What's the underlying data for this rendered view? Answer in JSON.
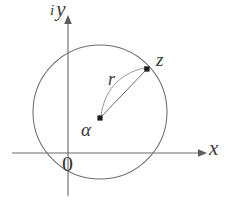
{
  "figure": {
    "name": "complex-plane-disk-diagram",
    "background_color": "#ffffff",
    "stroke_color": "#5a5a5a",
    "label_color": "#3a3a3a",
    "axes": {
      "x_label": "x",
      "y_label": "y",
      "y_label_prefix": "i",
      "origin_label": "0",
      "x_axis_y_px": 153,
      "y_axis_x_px": 68,
      "x_arrow": "arrow-right",
      "y_arrow": "arrow-up"
    },
    "circle": {
      "center_x_px": 100,
      "center_y_px": 112,
      "radius_px": 67,
      "filled": false
    },
    "points": [
      {
        "id": "alpha",
        "label": "α",
        "x_px": 100,
        "y_px": 118,
        "marker": "filled-square"
      },
      {
        "id": "z",
        "label": "z",
        "x_px": 147,
        "y_px": 69,
        "marker": "filled-square"
      }
    ],
    "segments": [
      {
        "id": "radius-segment",
        "from": "alpha",
        "to": "z",
        "style": "solid"
      }
    ],
    "arcs": [
      {
        "id": "radius-arc",
        "from": "alpha",
        "to": "z",
        "label": "r",
        "style": "curved-arrow"
      }
    ]
  }
}
